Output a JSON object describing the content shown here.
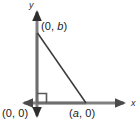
{
  "figure": {
    "type": "right-triangle-coordinate-diagram",
    "background_color": "#ffffff",
    "width": 138,
    "height": 131,
    "axis_color": "#808080",
    "hypotenuse_color": "#3a3a3a",
    "leg_color": "#6e6e6e",
    "right_angle_marker_color": "#5a5a5a",
    "label_color": "#1a1a1a"
  },
  "axes": {
    "x_axis_label": "x",
    "y_axis_label": "y",
    "origin_px": {
      "x": 37,
      "y": 103
    },
    "x_axis": {
      "left_tip_px": 22,
      "right_tip_px": 126,
      "y_px": 103,
      "arrows": "both"
    },
    "y_axis": {
      "top_tip_px": 10,
      "bottom_tip_px": 118,
      "x_px": 37,
      "arrows": "both"
    }
  },
  "labels": {
    "vertex_top": "(0, b)",
    "vertex_top_prefix": "(0, ",
    "vertex_top_var": "b",
    "vertex_top_suffix": ")",
    "vertex_origin": "(0, 0)",
    "vertex_right": "(a, 0)",
    "vertex_right_prefix": "(",
    "vertex_right_var": "a",
    "vertex_right_suffix": ", 0)"
  },
  "triangle": {
    "vertices": [
      {
        "name": "(0, b)",
        "px": {
          "x": 37,
          "y": 33
        }
      },
      {
        "name": "(0, 0)",
        "px": {
          "x": 37,
          "y": 103
        }
      },
      {
        "name": "(a, 0)",
        "px": {
          "x": 86,
          "y": 103
        }
      }
    ],
    "right_angle_at": "(0, 0)",
    "right_angle_marker_size_px": 9,
    "filled": false
  }
}
